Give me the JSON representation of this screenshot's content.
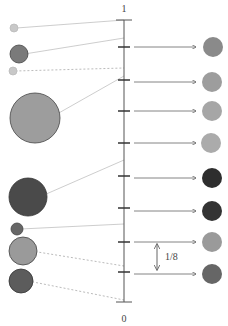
{
  "axis": {
    "x": 124,
    "top_y": 20,
    "bottom_y": 302,
    "top_label": "1",
    "bottom_label": "0",
    "color": "#555555",
    "ticks_y": [
      47,
      80,
      111,
      143,
      176,
      208,
      242,
      272
    ]
  },
  "interval_annotation": {
    "label": "1/8",
    "x": 157,
    "y1": 244,
    "y2": 270
  },
  "left_circles": [
    {
      "cx": 14,
      "cy": 28,
      "r": 4,
      "fill": "#c8c8c8",
      "stroke": "#bbbbbb",
      "target_y": 20,
      "line": "solid"
    },
    {
      "cx": 19,
      "cy": 54,
      "r": 9,
      "fill": "#7a7a7a",
      "stroke": "#444444",
      "target_y": 38,
      "line": "solid"
    },
    {
      "cx": 13,
      "cy": 71,
      "r": 4,
      "fill": "#c8c8c8",
      "stroke": "#bbbbbb",
      "target_y": 68,
      "line": "dashed"
    },
    {
      "cx": 35,
      "cy": 118,
      "r": 25,
      "fill": "#9d9d9d",
      "stroke": "#444444",
      "target_y": 76,
      "line": "solid"
    },
    {
      "cx": 28,
      "cy": 197,
      "r": 19,
      "fill": "#4a4a4a",
      "stroke": "#333333",
      "target_y": 160,
      "line": "solid"
    },
    {
      "cx": 17,
      "cy": 229,
      "r": 6,
      "fill": "#666666",
      "stroke": "#444444",
      "target_y": 224,
      "line": "solid"
    },
    {
      "cx": 23,
      "cy": 251,
      "r": 14,
      "fill": "#9a9a9a",
      "stroke": "#444444",
      "target_y": 266,
      "line": "dashed"
    },
    {
      "cx": 21,
      "cy": 281,
      "r": 12,
      "fill": "#5c5c5c",
      "stroke": "#333333",
      "target_y": 300,
      "line": "dashed"
    }
  ],
  "right_circles": [
    {
      "cx": 213,
      "cy": 47,
      "r": 10,
      "fill": "#8a8a8a"
    },
    {
      "cx": 212,
      "cy": 82,
      "r": 10,
      "fill": "#9d9d9d"
    },
    {
      "cx": 212,
      "cy": 111,
      "r": 10,
      "fill": "#a6a6a6"
    },
    {
      "cx": 211,
      "cy": 143,
      "r": 10,
      "fill": "#ababab"
    },
    {
      "cx": 212,
      "cy": 178,
      "r": 10,
      "fill": "#2e2e2e"
    },
    {
      "cx": 212,
      "cy": 211,
      "r": 10,
      "fill": "#333333"
    },
    {
      "cx": 212,
      "cy": 242,
      "r": 10,
      "fill": "#9a9a9a"
    },
    {
      "cx": 212,
      "cy": 274,
      "r": 10,
      "fill": "#666666"
    }
  ],
  "arrows": {
    "x1": 134,
    "x2": 196,
    "color": "#666666"
  }
}
